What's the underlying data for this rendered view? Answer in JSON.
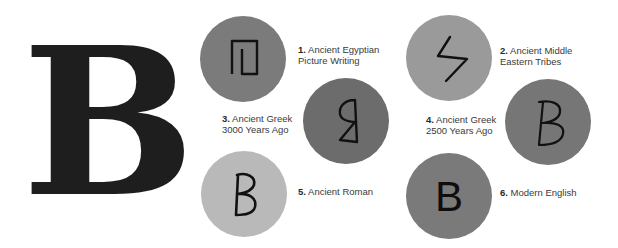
{
  "main_letter": "B",
  "stages": [
    {
      "number": "1.",
      "line1": "Ancient Egyptian",
      "line2": "Picture Writing",
      "color": "#7b7b7b",
      "glyph": "egyptian-house-icon"
    },
    {
      "number": "2.",
      "line1": "Ancient Middle",
      "line2": "Eastern Tribes",
      "color": "#9a9a9a",
      "glyph": "middle-eastern-beth-icon"
    },
    {
      "number": "3.",
      "line1": "Ancient Greek",
      "line2": "3000 Years Ago",
      "color": "#6c6c6c",
      "glyph": "greek-3000-beta-icon"
    },
    {
      "number": "4.",
      "line1": "Ancient Greek",
      "line2": "2500 Years Ago",
      "color": "#767676",
      "glyph": "greek-2500-b-icon"
    },
    {
      "number": "5.",
      "line1": "Ancient Roman",
      "line2": "",
      "color": "#b9b9b9",
      "glyph": "roman-b-icon"
    },
    {
      "number": "6.",
      "line1": "Modern English",
      "line2": "",
      "color": "#7a7a7a",
      "glyph": "modern-b-icon",
      "glyph_text": "B"
    }
  ]
}
